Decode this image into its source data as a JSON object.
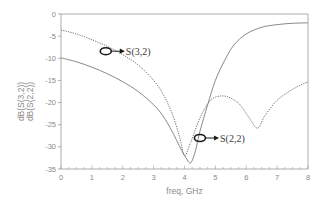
{
  "chart_data": {
    "type": "line",
    "title": "",
    "xlabel": "freq, GHz",
    "ylabel_lines": [
      "dB(S(3,2))",
      "dB(S(2,2))"
    ],
    "xlim": [
      0,
      8
    ],
    "ylim": [
      -35,
      0
    ],
    "x_ticks": [
      0,
      1,
      2,
      3,
      4,
      5,
      6,
      7,
      8
    ],
    "y_ticks": [
      0,
      -5,
      -10,
      -15,
      -20,
      -25,
      -30,
      -35
    ],
    "grid": false,
    "legend": "none (inline annotations)",
    "series": [
      {
        "name": "dB(S(3,2))",
        "style": "dotted",
        "color": "#707070",
        "x": [
          0,
          0.5,
          1,
          1.5,
          2,
          2.5,
          3,
          3.3,
          3.6,
          3.85,
          4.0,
          4.2,
          4.5,
          4.8,
          5.0,
          5.25,
          5.5,
          5.8,
          6.1,
          6.37,
          6.6,
          7.0,
          7.5,
          8.0
        ],
        "y": [
          -3.6,
          -4.5,
          -5.8,
          -7.3,
          -9.2,
          -11.5,
          -15.0,
          -18.0,
          -22.5,
          -28.0,
          -32.0,
          -29.0,
          -23.5,
          -19.8,
          -18.8,
          -18.5,
          -19.0,
          -20.5,
          -23.5,
          -25.8,
          -23.0,
          -19.5,
          -17.0,
          -15.3
        ]
      },
      {
        "name": "dB(S(2,2))",
        "style": "solid",
        "color": "#7a7a7a",
        "x": [
          0,
          0.5,
          1,
          1.5,
          2,
          2.5,
          3,
          3.3,
          3.6,
          3.85,
          4.05,
          4.2,
          4.35,
          4.5,
          4.75,
          5.0,
          5.3,
          5.6,
          6.0,
          6.5,
          7.0,
          7.5,
          8.0
        ],
        "y": [
          -9.9,
          -10.8,
          -12.0,
          -13.5,
          -15.3,
          -17.5,
          -20.5,
          -23.0,
          -26.5,
          -30.0,
          -32.5,
          -33.6,
          -31.0,
          -26.5,
          -20.5,
          -15.0,
          -10.5,
          -7.0,
          -4.5,
          -3.0,
          -2.4,
          -2.1,
          -2.0
        ]
      }
    ],
    "annotations": [
      {
        "label": "S(3,2)",
        "marker_at": {
          "x": 1.45,
          "y": -8.4
        },
        "text_at": {
          "x": 2.1,
          "y": -8.4
        }
      },
      {
        "label": "S(2,2)",
        "marker_at": {
          "x": 4.5,
          "y": -28.0
        },
        "text_at": {
          "x": 5.15,
          "y": -28.0
        }
      }
    ]
  },
  "plot_area": {
    "left": 61,
    "top": 14,
    "right": 308,
    "bottom": 169
  },
  "colors": {
    "axis": "#9a9a9a",
    "tick_text": "#8a8a8a",
    "annotation": "#2a2a2a"
  }
}
